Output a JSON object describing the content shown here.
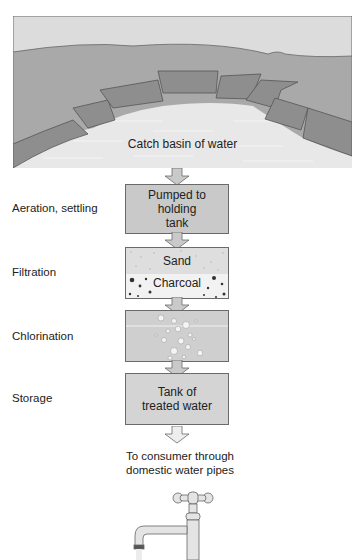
{
  "diagram": {
    "basin": {
      "label": "Catch basin of water"
    },
    "steps": [
      {
        "stage": "Aeration, settling",
        "box_lines": [
          "Pumped to",
          "holding",
          "tank"
        ]
      },
      {
        "stage": "Filtration",
        "box_layers": [
          "Sand",
          "Charcoal"
        ]
      },
      {
        "stage": "Chlorination",
        "box_lines": []
      },
      {
        "stage": "Storage",
        "box_lines": [
          "Tank of",
          "treated water"
        ]
      }
    ],
    "output": {
      "lines": [
        "To consumer through",
        "domestic water pipes"
      ]
    },
    "icons": [
      "down-arrow-icon",
      "water-tap-icon",
      "chlorine-bubbles-icon"
    ],
    "colors": {
      "box_fill": "#c9c9c9",
      "land": "#a7a7a7",
      "wall": "#8c8c8c",
      "water": "#e6e6e6",
      "border": "#6a6a6a"
    }
  }
}
